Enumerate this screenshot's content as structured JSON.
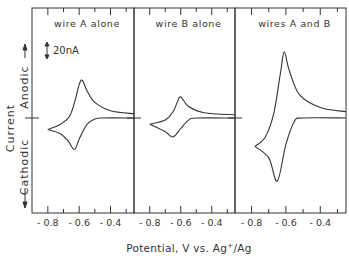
{
  "chart_data": {
    "type": "line",
    "title": "",
    "xlabel": "Potential, V vs. Ag+/Ag",
    "xlabel_parts": {
      "prefix": "Potential, V vs. Ag",
      "sup": "+",
      "suffix": "/Ag"
    },
    "ylabel": "Current",
    "ylabel_anodic": "Anodic",
    "ylabel_cathodic": "Cathodic",
    "scale_bar_label": "20nA",
    "xlim": [
      -0.85,
      -0.25
    ],
    "xticks": [
      "-0.8",
      "-0.6",
      "-0.4"
    ],
    "grid": false,
    "legend": "none",
    "panels": [
      {
        "name": "wire A alone",
        "label": "wire A alone",
        "anodic_peak": {
          "x": -0.58,
          "y_nA": 36
        },
        "cathodic_peak": {
          "x": -0.63,
          "y_nA": -30
        },
        "switching_potential": -0.8,
        "series": [
          {
            "name": "forward (cathodic) scan",
            "x": [
              -0.25,
              -0.45,
              -0.5,
              -0.55,
              -0.6,
              -0.63,
              -0.67,
              -0.72,
              -0.8
            ],
            "y_nA": [
              0,
              0,
              -1,
              -6,
              -20,
              -30,
              -22,
              -15,
              -11
            ]
          },
          {
            "name": "reverse (anodic) scan",
            "x": [
              -0.8,
              -0.72,
              -0.66,
              -0.62,
              -0.6,
              -0.58,
              -0.55,
              -0.5,
              -0.4,
              -0.25
            ],
            "y_nA": [
              -11,
              -6,
              2,
              20,
              32,
              36,
              26,
              15,
              7,
              4
            ]
          }
        ]
      },
      {
        "name": "wire B alone",
        "label": "wire B alone",
        "anodic_peak": {
          "x": -0.6,
          "y_nA": 20
        },
        "cathodic_peak": {
          "x": -0.65,
          "y_nA": -18
        },
        "switching_potential": -0.8,
        "series": [
          {
            "name": "forward (cathodic) scan",
            "x": [
              -0.25,
              -0.5,
              -0.55,
              -0.6,
              -0.65,
              -0.7,
              -0.8
            ],
            "y_nA": [
              0,
              0,
              -2,
              -10,
              -18,
              -13,
              -6
            ]
          },
          {
            "name": "reverse (anodic) scan",
            "x": [
              -0.8,
              -0.7,
              -0.65,
              -0.62,
              -0.6,
              -0.55,
              -0.45,
              -0.25
            ],
            "y_nA": [
              -6,
              -2,
              6,
              16,
              20,
              11,
              5,
              3
            ]
          }
        ]
      },
      {
        "name": "wires A and B",
        "label": "wires A and B",
        "anodic_peak": {
          "x": -0.61,
          "y_nA": 63
        },
        "cathodic_peak": {
          "x": -0.65,
          "y_nA": -60
        },
        "switching_potential": -0.78,
        "series": [
          {
            "name": "forward (cathodic) scan",
            "x": [
              -0.25,
              -0.5,
              -0.55,
              -0.6,
              -0.65,
              -0.7,
              -0.78
            ],
            "y_nA": [
              0,
              0,
              -3,
              -25,
              -60,
              -38,
              -27
            ]
          },
          {
            "name": "reverse (anodic) scan",
            "x": [
              -0.78,
              -0.72,
              -0.67,
              -0.63,
              -0.61,
              -0.58,
              -0.52,
              -0.4,
              -0.25
            ],
            "y_nA": [
              -27,
              -18,
              5,
              45,
              63,
              45,
              22,
              10,
              6
            ]
          }
        ]
      }
    ]
  }
}
